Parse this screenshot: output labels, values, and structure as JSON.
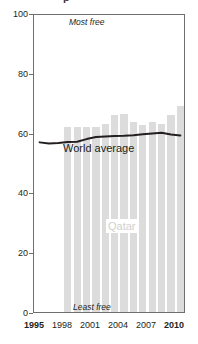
{
  "chart_data": {
    "type": "bar",
    "title": "",
    "xlabel": "",
    "ylabel": "",
    "ylim": [
      0,
      100
    ],
    "xlim": [
      1994.4,
      2010.6
    ],
    "grid": false,
    "legend": "none",
    "y_ticks": [
      0,
      20,
      40,
      60,
      80,
      100
    ],
    "x_ticks": [
      1995,
      1998,
      2001,
      2004,
      2007,
      2010
    ],
    "x_tick_labels": [
      "1995",
      "1998",
      "2001",
      "2004",
      "2007",
      "2010"
    ],
    "bold_x_tick_labels": [
      "1995",
      "2010"
    ],
    "categories": [
      1998,
      1999,
      2000,
      2001,
      2002,
      2003,
      2004,
      2005,
      2006,
      2007,
      2008,
      2009,
      2010
    ],
    "series": [
      {
        "name": "Qatar",
        "type": "bar",
        "color": "#dcdcdc",
        "x": [
          1998,
          1999,
          2000,
          2001,
          2002,
          2003,
          2004,
          2005,
          2006,
          2007,
          2008,
          2009,
          2010
        ],
        "values": [
          62.0,
          62.0,
          62.0,
          61.8,
          63.0,
          66.0,
          66.2,
          63.6,
          62.5,
          63.4,
          62.8,
          66.0,
          69.0
        ]
      },
      {
        "name": "World average",
        "type": "line",
        "color": "#231f20",
        "x": [
          1995,
          1996,
          1997,
          1998,
          1999,
          2000,
          2001,
          2002,
          2003,
          2004,
          2005,
          2006,
          2007,
          2008,
          2009,
          2010
        ],
        "values": [
          57.4,
          57.0,
          57.2,
          57.5,
          57.6,
          58.5,
          59.2,
          59.4,
          59.5,
          59.6,
          59.8,
          60.1,
          60.4,
          60.6,
          60.0,
          59.7
        ]
      }
    ],
    "annotations": [
      {
        "name": "most-free",
        "text": "Most free",
        "x": 2001.2,
        "y": 97,
        "style": "italic"
      },
      {
        "name": "least-free",
        "text": "Least free",
        "x": 2001.6,
        "y": 2.5,
        "style": "italic"
      },
      {
        "name": "world-average-label",
        "text": "World average",
        "x": 1999.2,
        "y": 54,
        "style": "normal"
      },
      {
        "name": "qatar-label",
        "text": "Qatar",
        "x": 2003.6,
        "y": 30,
        "style": "normal"
      }
    ],
    "title_remnant": "p"
  },
  "axes": {
    "y_labels": [
      "100",
      "80",
      "60",
      "40",
      "20",
      "0"
    ],
    "x_labels": [
      "1995",
      "1998",
      "2001",
      "2004",
      "2007",
      "2010"
    ]
  },
  "labels": {
    "most_free": "Most free",
    "least_free": "Least free",
    "world_average": "World average",
    "qatar": "Qatar"
  },
  "colors": {
    "bar": "#dcdcdc",
    "line": "#231f20",
    "frame": "#6f6f6f",
    "qatar_label": "#d0d0d0",
    "background": "#ffffff"
  }
}
